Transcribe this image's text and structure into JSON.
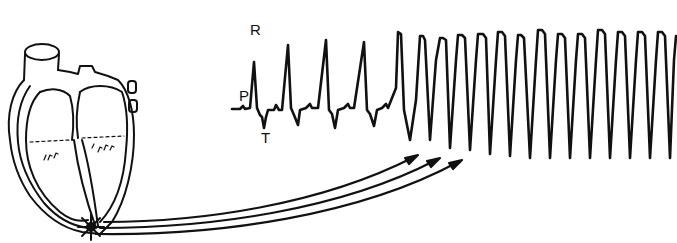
{
  "figure": {
    "colors": {
      "ink": "#111111",
      "background": "#ffffff"
    }
  },
  "ecg": {
    "labels": {
      "p_wave": "P",
      "r_wave": "R",
      "t_wave": "T"
    },
    "normal_beats": 4,
    "tachycardia_beats": 16
  },
  "heart": {
    "focus_marker": "starburst",
    "arrows_count": 3
  }
}
